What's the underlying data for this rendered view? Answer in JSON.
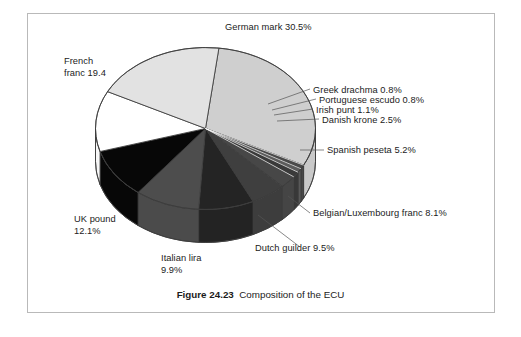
{
  "figure": {
    "caption_number": "Figure 24.23",
    "caption_text": "Composition of the ECU",
    "border_color": "#b9b9b9",
    "background": "#ffffff"
  },
  "chart_data": {
    "type": "pie",
    "title": "Composition of the ECU",
    "subtitle": "",
    "xlabel": "",
    "ylabel": "",
    "legend_position": "callout-labels",
    "grid": false,
    "units": "percent",
    "three_d": true,
    "start_angle_deg": -83,
    "direction": "clockwise",
    "categories": [
      "German mark",
      "Greek drachma",
      "Portuguese escudo",
      "Irish punt",
      "Danish krone",
      "Spanish peseta",
      "Belgian/Luxembourg franc",
      "Dutch guilder",
      "Italian lira",
      "UK pound",
      "French franc"
    ],
    "values": [
      30.5,
      0.8,
      0.8,
      1.1,
      2.5,
      5.2,
      8.1,
      9.5,
      9.9,
      12.1,
      19.4
    ],
    "colors": [
      "#cfcfcf",
      "#4a4a4a",
      "#5c5c5c",
      "#3a3a3a",
      "#474747",
      "#3f3f3f",
      "#242424",
      "#4d4d4d",
      "#070707",
      "#ffffff",
      "#e2e2e2"
    ],
    "slices": [
      {
        "label": "German mark",
        "value": 30.5,
        "display": "German mark 30.5%",
        "color": "#cfcfcf"
      },
      {
        "label": "Greek drachma",
        "value": 0.8,
        "display": "Greek drachma 0.8%",
        "color": "#4a4a4a"
      },
      {
        "label": "Portuguese escudo",
        "value": 0.8,
        "display": "Portuguese escudo 0.8%",
        "color": "#5c5c5c"
      },
      {
        "label": "Irish punt",
        "value": 1.1,
        "display": "Irish punt 1.1%",
        "color": "#3a3a3a"
      },
      {
        "label": "Danish krone",
        "value": 2.5,
        "display": "Danish krone 2.5%",
        "color": "#474747"
      },
      {
        "label": "Spanish peseta",
        "value": 5.2,
        "display": "Spanish peseta 5.2%",
        "color": "#3f3f3f"
      },
      {
        "label": "Belgian/Luxembourg franc",
        "value": 8.1,
        "display": "Belgian/Luxembourg franc 8.1%",
        "color": "#242424"
      },
      {
        "label": "Dutch guilder",
        "value": 9.5,
        "display": "Dutch guilder 9.5%",
        "color": "#4d4d4d"
      },
      {
        "label": "Italian lira",
        "value": 9.9,
        "display": "Italian lira\n9.9%",
        "color": "#070707"
      },
      {
        "label": "UK pound",
        "value": 12.1,
        "display": "UK pound\n12.1%",
        "color": "#ffffff"
      },
      {
        "label": "French franc",
        "value": 19.4,
        "display": "French\nfranc 19.4",
        "color": "#e2e2e2"
      }
    ]
  },
  "labels": {
    "german_mark": "German mark 30.5%",
    "french_franc": "French\nfranc 19.4",
    "greek_drachma": "Greek drachma 0.8%",
    "portuguese_escudo": "Portuguese escudo 0.8%",
    "irish_punt": "Irish punt 1.1%",
    "danish_krone": "Danish krone 2.5%",
    "spanish_peseta": "Spanish peseta 5.2%",
    "belgian_lux_franc": "Belgian/Luxembourg franc 8.1%",
    "dutch_guilder": "Dutch guilder 9.5%",
    "italian_lira": "Italian lira\n9.9%",
    "uk_pound": "UK pound\n12.1%"
  }
}
